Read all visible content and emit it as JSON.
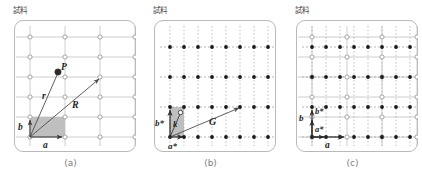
{
  "figure": {
    "panel_count": 3,
    "colors": {
      "frame": "#b9b9b9",
      "real_grid_line": "#bfbfbf",
      "real_point_stroke": "#8f8f8f",
      "reciprocal_point_fill": "#1a1a1a",
      "reciprocal_grid_line": "#9a9a9a",
      "vector": "#4d4d4d",
      "cell_fill": "#b3b3b3",
      "caption_text": "#7d7d7d",
      "sample_text": "#4a4a4a"
    }
  },
  "panels": [
    {
      "id": "a",
      "sample_label": "試料",
      "caption": "(a)",
      "lattice_type": "real",
      "point_style": "open-circle",
      "grid_line_style": "solid",
      "cols": 5,
      "rows": 6,
      "labels": {
        "point_p": "P",
        "vector_r": "r",
        "vector_R": "R",
        "axis_a": "a",
        "axis_b": "b"
      },
      "vectors": [
        {
          "name": "r",
          "label": "r",
          "from": [
            0,
            0
          ],
          "to": [
            0.62,
            2.45
          ],
          "tip": "circle"
        },
        {
          "name": "R",
          "label": "R",
          "from": [
            0,
            0
          ],
          "to": [
            2.0,
            3.0
          ],
          "tip": "arrow"
        },
        {
          "name": "a",
          "label": "a",
          "from": [
            0,
            0
          ],
          "to": [
            1.0,
            0
          ],
          "tip": "arrow"
        },
        {
          "name": "b",
          "label": "b",
          "from": [
            0,
            0
          ],
          "to": [
            0,
            1.0
          ],
          "tip": "arrow"
        }
      ],
      "unit_cell": {
        "shaded": true,
        "width_cells": 1,
        "height_cells": 1
      }
    },
    {
      "id": "b",
      "sample_label": "試料",
      "caption": "(b)",
      "lattice_type": "reciprocal",
      "point_style": "filled-dot",
      "grid_line_style": "dashed",
      "cols": 8,
      "rows": 4,
      "labels": {
        "vector_G": "G",
        "vector_k": "k",
        "axis_a_star": "a*",
        "axis_b_star": "b*"
      },
      "vectors": [
        {
          "name": "G",
          "label": "G",
          "from": [
            0,
            0
          ],
          "to": [
            4.0,
            1.0
          ],
          "tip": "arrow"
        },
        {
          "name": "k",
          "label": "k",
          "from": [
            0,
            0
          ],
          "to": [
            0.35,
            0.72
          ],
          "tip": "circle"
        },
        {
          "name": "a*",
          "label": "a*",
          "from": [
            0,
            0
          ],
          "to": [
            1.0,
            0
          ],
          "tip": "arrow"
        },
        {
          "name": "b*",
          "label": "b*",
          "from": [
            0,
            0
          ],
          "to": [
            0,
            1.0
          ],
          "tip": "arrow"
        }
      ],
      "unit_cell": {
        "shaded": true,
        "width_cells": 1,
        "height_cells": 1
      }
    },
    {
      "id": "c",
      "sample_label": "試料",
      "caption": "(c)",
      "lattice_type": "superposed",
      "point_style": "open-circle-and-filled-dot",
      "grid_line_style": "solid-and-dashed",
      "real_cols": 5,
      "real_rows": 6,
      "reciprocal_cols": 8,
      "reciprocal_rows": 4,
      "labels": {
        "axis_a": "a",
        "axis_b": "b",
        "axis_a_star": "a*",
        "axis_b_star": "b*"
      },
      "vectors": [
        {
          "name": "a",
          "label": "a",
          "from": [
            0,
            0
          ],
          "to": [
            1.0,
            0
          ],
          "tip": "arrow"
        },
        {
          "name": "b",
          "label": "b",
          "from": [
            0,
            0
          ],
          "to": [
            0,
            1.0
          ],
          "tip": "arrow"
        },
        {
          "name": "a*",
          "label": "a*",
          "from": [
            0,
            0
          ],
          "to": [
            0.45,
            0
          ],
          "tip": "arrow"
        },
        {
          "name": "b*",
          "label": "b*",
          "from": [
            0,
            0
          ],
          "to": [
            0,
            0.52
          ],
          "tip": "arrow"
        }
      ]
    }
  ]
}
